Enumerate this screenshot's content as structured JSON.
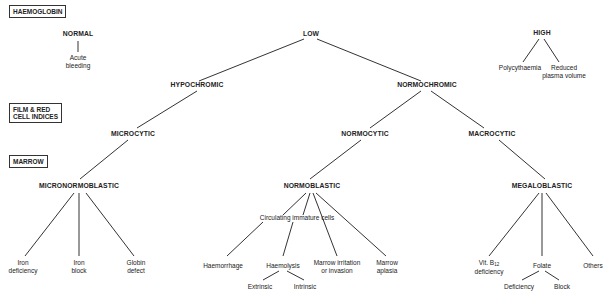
{
  "section_labels": {
    "haemoglobin": "HAEMOGLOBIN",
    "film_line1": "FILM & RED",
    "film_line2": "CELL INDICES",
    "marrow": "MARROW"
  },
  "nodes": {
    "normal": "NORMAL",
    "acute_bleeding_1": "Acute",
    "acute_bleeding_2": "bleeding",
    "low": "LOW",
    "high": "HIGH",
    "polycythaemia": "Polycythaemia",
    "reduced_1": "Reduced",
    "reduced_2": "plasma volume",
    "hypochromic": "HYPOCHROMIC",
    "normochromic": "NORMOCHROMIC",
    "microcytic": "MICROCYTIC",
    "normocytic": "NORMOCYTIC",
    "macrocytic": "MACROCYTIC",
    "micronormoblastic": "MICRONORMOBLASTIC",
    "normoblastic": "NORMOBLASTIC",
    "megaloblastic": "MEGALOBLASTIC",
    "iron_def_1": "Iron",
    "iron_def_2": "deficiency",
    "iron_block_1": "Iron",
    "iron_block_2": "block",
    "globin_1": "Globin",
    "globin_2": "defect",
    "circulating": "Circulating immature cells",
    "haemorrhage": "Haemorrhage",
    "haemolysis": "Haemolysis",
    "extrinsic": "Extrinsic",
    "intrinsic": "Intrinsic",
    "marrow_irr_1": "Marrow irritation",
    "marrow_irr_2": "or invasion",
    "marrow_apl_1": "Marrow",
    "marrow_apl_2": "aplasia",
    "vitb12_1": "Vit. B",
    "vitb12_sub": "12",
    "vitb12_2": "deficiency",
    "folate": "Folate",
    "folate_def": "Deficiency",
    "folate_block": "Block",
    "others": "Others"
  }
}
